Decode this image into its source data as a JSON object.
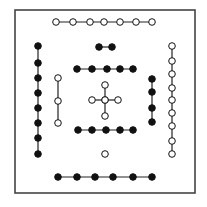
{
  "diagram": {
    "frame": {
      "x": 15,
      "y": 10,
      "width": 180,
      "height": 183,
      "stroke": "#444444"
    },
    "colors": {
      "filled": "#111111",
      "hollow_fill": "#ffffff",
      "stroke": "#111111",
      "line": "#222222"
    },
    "dot_radius": 3.3,
    "groups": [
      {
        "name": "top-hollow-row",
        "kind": "hollow",
        "orientation": "horizontal",
        "points": [
          [
            56,
            22
          ],
          [
            73,
            22
          ],
          [
            90,
            22
          ],
          [
            104,
            22
          ],
          [
            120,
            22
          ],
          [
            136,
            22
          ],
          [
            152,
            22
          ]
        ]
      },
      {
        "name": "black-pair",
        "kind": "filled",
        "orientation": "horizontal",
        "points": [
          [
            99,
            47
          ],
          [
            112,
            47
          ]
        ]
      },
      {
        "name": "left-filled-column",
        "kind": "filled",
        "orientation": "vertical",
        "points": [
          [
            38,
            46
          ],
          [
            38,
            63
          ],
          [
            38,
            78
          ],
          [
            38,
            93
          ],
          [
            38,
            108
          ],
          [
            38,
            123
          ],
          [
            38,
            138
          ],
          [
            38,
            154
          ]
        ]
      },
      {
        "name": "left-hollow-column",
        "kind": "hollow",
        "orientation": "vertical",
        "points": [
          [
            58,
            78
          ],
          [
            58,
            101
          ],
          [
            58,
            123
          ]
        ]
      },
      {
        "name": "upper-filled-row",
        "kind": "filled",
        "orientation": "horizontal",
        "points": [
          [
            77,
            69
          ],
          [
            92,
            69
          ],
          [
            107,
            69
          ],
          [
            120,
            69
          ],
          [
            133,
            69
          ]
        ]
      },
      {
        "name": "center-hollow-cross-vertical",
        "kind": "hollow",
        "orientation": "vertical",
        "points": [
          [
            105,
            85
          ],
          [
            105,
            100
          ],
          [
            105,
            116
          ]
        ]
      },
      {
        "name": "center-hollow-cross-horizontal",
        "kind": "hollow",
        "orientation": "horizontal",
        "points": [
          [
            92,
            100
          ],
          [
            105,
            100
          ],
          [
            118,
            100
          ]
        ]
      },
      {
        "name": "right-filled-column",
        "kind": "filled",
        "orientation": "vertical",
        "points": [
          [
            152,
            79
          ],
          [
            152,
            92
          ],
          [
            152,
            108
          ],
          [
            152,
            122
          ]
        ]
      },
      {
        "name": "right-hollow-column",
        "kind": "hollow",
        "orientation": "vertical",
        "points": [
          [
            172,
            46
          ],
          [
            172,
            61
          ],
          [
            172,
            74
          ],
          [
            172,
            88
          ],
          [
            172,
            100
          ],
          [
            172,
            113
          ],
          [
            172,
            126
          ],
          [
            172,
            141
          ],
          [
            172,
            154
          ]
        ]
      },
      {
        "name": "lower-filled-row",
        "kind": "filled",
        "orientation": "horizontal",
        "points": [
          [
            78,
            130
          ],
          [
            92,
            130
          ],
          [
            106,
            130
          ],
          [
            120,
            130
          ],
          [
            133,
            130
          ]
        ]
      },
      {
        "name": "single-hollow-dot",
        "kind": "hollow",
        "orientation": "none",
        "points": [
          [
            105,
            154
          ]
        ]
      },
      {
        "name": "bottom-filled-row",
        "kind": "filled",
        "orientation": "horizontal",
        "points": [
          [
            58,
            177
          ],
          [
            77,
            177
          ],
          [
            95,
            177
          ],
          [
            113,
            177
          ],
          [
            133,
            177
          ],
          [
            152,
            177
          ]
        ]
      }
    ]
  }
}
